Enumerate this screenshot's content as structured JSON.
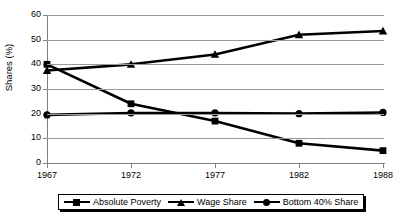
{
  "chart_data": {
    "type": "line",
    "title": "",
    "xlabel": "",
    "ylabel": "Shares (%)",
    "categories": [
      "1967",
      "1972",
      "1977",
      "1982",
      "1988"
    ],
    "ylim": [
      0,
      60
    ],
    "yticks": [
      0,
      10,
      20,
      30,
      40,
      50,
      60
    ],
    "grid": true,
    "legend_position": "bottom",
    "series": [
      {
        "name": "Absolute Poverty",
        "marker": "square",
        "color": "#000000",
        "values": [
          40,
          24,
          17,
          8,
          5
        ]
      },
      {
        "name": "Wage Share",
        "marker": "triangle",
        "color": "#000000",
        "values": [
          37.5,
          40,
          44,
          52,
          53.5
        ]
      },
      {
        "name": "Bottom 40% Share",
        "marker": "circle",
        "color": "#000000",
        "values": [
          19.5,
          20.3,
          20.3,
          20,
          20.5
        ]
      }
    ]
  }
}
